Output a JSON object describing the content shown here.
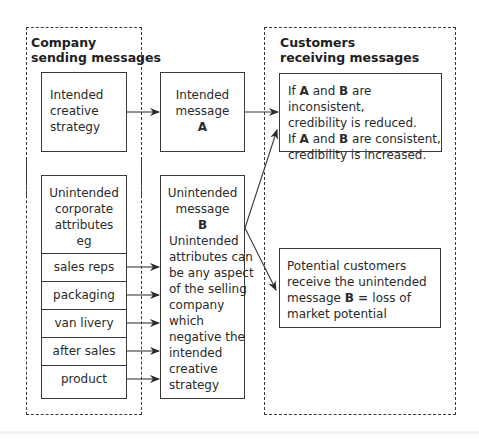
{
  "groups": {
    "company": {
      "title_line1": "Company",
      "title_line2": "sending messages"
    },
    "customers": {
      "title_line1": "Customers",
      "title_line2": "receiving messages"
    }
  },
  "boxes": {
    "creative_strategy": {
      "lines": [
        "Intended",
        "creative",
        "strategy"
      ]
    },
    "intended_message": {
      "lines": [
        "Intended",
        "message"
      ],
      "letter": "A"
    },
    "corporate_attributes": {
      "header_lines": [
        "Unintended",
        "corporate",
        "attributes",
        "eg"
      ],
      "items": [
        "sales reps",
        "packaging",
        "van livery",
        "after sales",
        "product"
      ]
    },
    "unintended_message": {
      "lines": [
        "Unintended",
        "message"
      ],
      "letter": "B",
      "description_lines": [
        "Unintended",
        "attributes can",
        "be any aspect",
        "of the selling",
        "company",
        "which",
        "negative the",
        "intended",
        "creative",
        "strategy"
      ]
    },
    "credibility": {
      "l1_pre": "If ",
      "l1_a": "A",
      "l1_mid": " and ",
      "l1_b": "B",
      "l1_post": " are inconsistent,",
      "l2": "credibility is reduced.",
      "l3_pre": "If ",
      "l3_a": "A",
      "l3_mid": " and ",
      "l3_b": "B",
      "l3_post": " are consistent,",
      "l4": "credibility is increased."
    },
    "potential_customers": {
      "l1": "Potential customers",
      "l2": "receive the unintended",
      "l3_pre": "message ",
      "l3_b": "B",
      "l3_eq": " = ",
      "l3_post": "loss of",
      "l4": "market potential"
    }
  },
  "colors": {
    "line": "#3a3a3a",
    "text": "#2a2a2a",
    "background": "#ffffff"
  }
}
